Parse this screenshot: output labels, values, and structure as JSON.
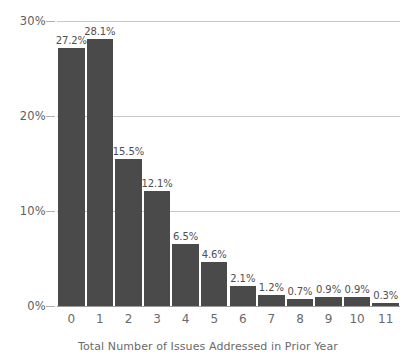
{
  "chart_data": {
    "type": "bar",
    "title": "",
    "subtitle": "",
    "xlabel": "Total Number of Issues Addressed in Prior Year",
    "ylabel": "",
    "categories": [
      "0",
      "1",
      "2",
      "3",
      "4",
      "5",
      "6",
      "7",
      "8",
      "9",
      "10",
      "11"
    ],
    "values": [
      27.2,
      28.1,
      15.5,
      12.1,
      6.5,
      4.6,
      2.1,
      1.2,
      0.7,
      0.9,
      0.9,
      0.3
    ],
    "data_labels": [
      "27.2%",
      "28.1%",
      "15.5%",
      "12.1%",
      "6.5%",
      "4.6%",
      "2.1%",
      "1.2%",
      "0.7%",
      "0.9%",
      "0.9%",
      "0.3%"
    ],
    "ylim": [
      0,
      30
    ],
    "yticks": [
      0,
      10,
      20,
      30
    ],
    "ytick_labels": [
      "0%",
      "10%",
      "20%",
      "30%"
    ],
    "grid": true,
    "legend": "none",
    "colors": {
      "bar": "#4a4a4a",
      "grid": "#c8c8c8",
      "axis": "#9a9a9a",
      "text": "#6a6a6a",
      "background": "#ffffff"
    }
  }
}
